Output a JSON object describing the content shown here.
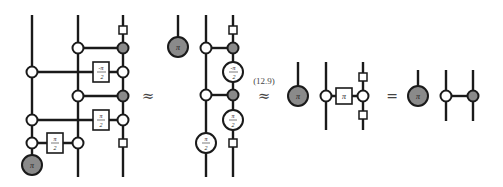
{
  "diagram": {
    "type": "zx-calculus equation chain",
    "colors": {
      "gray_spider": "#8a8a8a",
      "white_spider": "#ffffff",
      "stroke": "#1a1a1a"
    },
    "panels": [
      {
        "name": "circuit-1",
        "labels": {
          "neg_half_pi": "-π/2",
          "half_pi_a": "π/2",
          "half_pi_b": "π/2",
          "pi": "π"
        }
      },
      {
        "name": "circuit-2",
        "labels": {
          "pi": "π",
          "neg_half_pi": "-π/2",
          "half_pi_right": "π/2",
          "half_pi_left": "π/2"
        }
      },
      {
        "name": "circuit-3",
        "labels": {
          "pi": "π",
          "box_pi": "π"
        }
      },
      {
        "name": "circuit-4",
        "labels": {
          "pi": "π"
        }
      }
    ],
    "relations": {
      "approx1": "≈",
      "approx2": "≈",
      "equals": "="
    },
    "equation_ref": "(12.9)",
    "frac": {
      "pi": "π",
      "two": "2",
      "neg": "-"
    }
  }
}
